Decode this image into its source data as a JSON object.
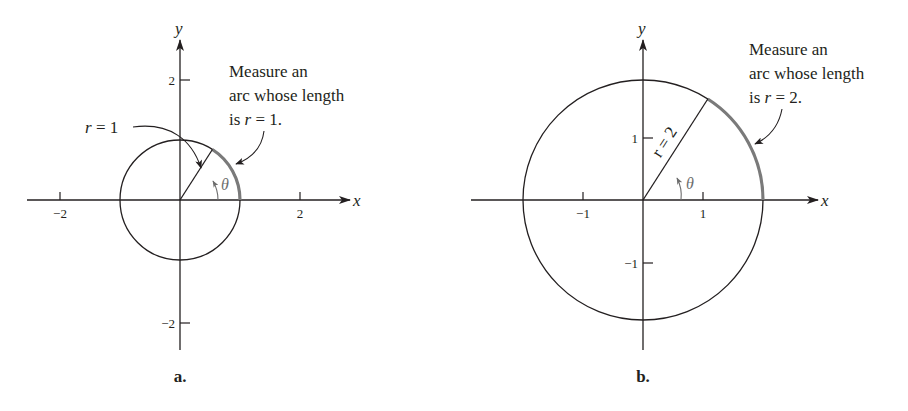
{
  "figure": {
    "panels": [
      {
        "id": "a",
        "panel_label": "a.",
        "x_axis_label": "x",
        "y_axis_label": "y",
        "x_ticks": [
          "−2",
          "2"
        ],
        "y_ticks": [
          "2",
          "−2"
        ],
        "radius_label": "r = 1",
        "radius": 1,
        "angle_label": "θ",
        "note_lines": [
          "Measure an",
          "arc whose length",
          "is r = 1."
        ],
        "note_prefix": "is ",
        "note_var": "r",
        "note_suffix": " = 1."
      },
      {
        "id": "b",
        "panel_label": "b.",
        "x_axis_label": "x",
        "y_axis_label": "y",
        "x_ticks": [
          "−1",
          "1"
        ],
        "y_ticks": [
          "1",
          "−1"
        ],
        "radius_label": "r = 2",
        "radius": 2,
        "angle_label": "θ",
        "note_lines": [
          "Measure an",
          "arc whose length",
          "is r = 2."
        ],
        "note_prefix": "is ",
        "note_var": "r",
        "note_suffix": " = 2."
      }
    ],
    "colors": {
      "ink": "#231f20",
      "arc_highlight": "#7a7a7a",
      "angle_marker": "#6d6d6d",
      "background": "#ffffff"
    }
  }
}
